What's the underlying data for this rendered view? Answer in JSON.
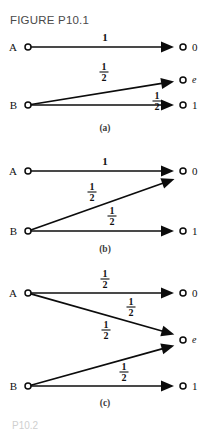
{
  "figure": {
    "title": "FIGURE P10.1",
    "bottom_fragment": "P10.2"
  },
  "panels": [
    {
      "id": "a",
      "caption": "(a)",
      "caption_x": 105,
      "caption_y": 131,
      "nodes": [
        {
          "name": "source-a",
          "label": "A",
          "label_style": "upright",
          "x": 28,
          "y": 47,
          "label_x": 17,
          "label_y": 51
        },
        {
          "name": "sink-0",
          "label": "0",
          "label_style": "upright",
          "x": 183,
          "y": 47,
          "label_x": 192,
          "label_y": 51
        },
        {
          "name": "source-b",
          "label": "B",
          "label_style": "upright",
          "x": 28,
          "y": 105,
          "label_x": 17,
          "label_y": 109
        },
        {
          "name": "sink-e",
          "label": "e",
          "label_style": "italic",
          "x": 183,
          "y": 80,
          "label_x": 192,
          "label_y": 83
        },
        {
          "name": "sink-1",
          "label": "1",
          "label_style": "upright",
          "x": 183,
          "y": 105,
          "label_x": 192,
          "label_y": 109
        }
      ],
      "edges": [
        {
          "name": "edge-a-to-0",
          "x1": 28,
          "y1": 47,
          "x2": 183,
          "y2": 47,
          "weight": "1",
          "weight_type": "whole",
          "wx": 105,
          "wy": 41
        },
        {
          "name": "edge-b-to-e",
          "x1": 28,
          "y1": 105,
          "x2": 183,
          "y2": 80,
          "weight": "1/2",
          "weight_type": "fraction",
          "numerator": "1",
          "denominator": "2",
          "wx": 104,
          "wy": 70
        },
        {
          "name": "edge-b-to-1",
          "x1": 28,
          "y1": 105,
          "x2": 183,
          "y2": 105,
          "weight": "1/2",
          "weight_type": "fraction",
          "numerator": "1",
          "denominator": "2",
          "wx": 157,
          "wy": 99
        }
      ]
    },
    {
      "id": "b",
      "caption": "(b)",
      "caption_x": 105,
      "caption_y": 252,
      "nodes": [
        {
          "name": "source-a",
          "label": "A",
          "label_style": "upright",
          "x": 28,
          "y": 171,
          "label_x": 17,
          "label_y": 175
        },
        {
          "name": "sink-0",
          "label": "0",
          "label_style": "upright",
          "x": 183,
          "y": 171,
          "label_x": 192,
          "label_y": 175
        },
        {
          "name": "source-b",
          "label": "B",
          "label_style": "upright",
          "x": 28,
          "y": 231,
          "label_x": 17,
          "label_y": 235
        },
        {
          "name": "sink-1",
          "label": "1",
          "label_style": "upright",
          "x": 183,
          "y": 231,
          "label_x": 192,
          "label_y": 235
        }
      ],
      "edges": [
        {
          "name": "edge-a-to-0",
          "x1": 28,
          "y1": 171,
          "x2": 183,
          "y2": 171,
          "weight": "1",
          "weight_type": "whole",
          "wx": 105,
          "wy": 165
        },
        {
          "name": "edge-b-to-0",
          "x1": 28,
          "y1": 231,
          "x2": 183,
          "y2": 176,
          "weight": "1/2",
          "weight_type": "fraction",
          "numerator": "1",
          "denominator": "2",
          "wx": 92,
          "wy": 190
        },
        {
          "name": "edge-b-to-1",
          "x1": 28,
          "y1": 231,
          "x2": 183,
          "y2": 231,
          "weight": "1/2",
          "weight_type": "fraction",
          "numerator": "1",
          "denominator": "2",
          "wx": 112,
          "wy": 214
        }
      ]
    },
    {
      "id": "c",
      "caption": "(c)",
      "caption_x": 105,
      "caption_y": 406,
      "nodes": [
        {
          "name": "source-a",
          "label": "A",
          "label_style": "upright",
          "x": 28,
          "y": 293,
          "label_x": 17,
          "label_y": 297
        },
        {
          "name": "sink-0",
          "label": "0",
          "label_style": "upright",
          "x": 183,
          "y": 293,
          "label_x": 192,
          "label_y": 297
        },
        {
          "name": "sink-e",
          "label": "e",
          "label_style": "italic",
          "x": 183,
          "y": 340,
          "label_x": 192,
          "label_y": 343
        },
        {
          "name": "source-b",
          "label": "B",
          "label_style": "upright",
          "x": 28,
          "y": 386,
          "label_x": 17,
          "label_y": 390
        },
        {
          "name": "sink-1",
          "label": "1",
          "label_style": "upright",
          "x": 183,
          "y": 386,
          "label_x": 192,
          "label_y": 390
        }
      ],
      "edges": [
        {
          "name": "edge-a-to-0",
          "x1": 28,
          "y1": 293,
          "x2": 183,
          "y2": 293,
          "weight": "1/2",
          "weight_type": "fraction",
          "numerator": "1",
          "denominator": "2",
          "wx": 105,
          "wy": 277
        },
        {
          "name": "edge-a-to-e",
          "x1": 28,
          "y1": 293,
          "x2": 183,
          "y2": 337,
          "weight": "1/2",
          "weight_type": "fraction",
          "numerator": "1",
          "denominator": "2",
          "wx": 131,
          "wy": 305
        },
        {
          "name": "edge-b-to-e",
          "x1": 28,
          "y1": 386,
          "x2": 183,
          "y2": 343,
          "weight": "1/2",
          "weight_type": "fraction",
          "numerator": "1",
          "denominator": "2",
          "wx": 106,
          "wy": 328
        },
        {
          "name": "edge-b-to-1",
          "x1": 28,
          "y1": 386,
          "x2": 183,
          "y2": 386,
          "weight": "1/2",
          "weight_type": "fraction",
          "numerator": "1",
          "denominator": "2",
          "wx": 124,
          "wy": 370
        }
      ]
    }
  ],
  "style": {
    "ink_color": "#0c0c0c",
    "paper_color": "#ffffff",
    "title_color": "#4a4a4a",
    "node_radius": 3,
    "arrow_length": 13,
    "arrow_half_width": 5.5,
    "arrow_gap": 9
  }
}
